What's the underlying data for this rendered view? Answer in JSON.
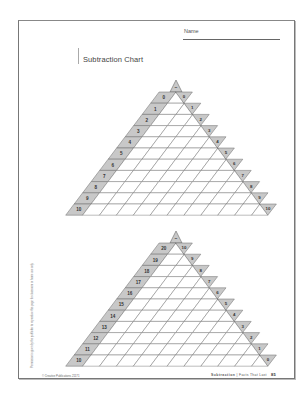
{
  "header": {
    "name_label": "Name",
    "title": "Subtraction Chart"
  },
  "charts": [
    {
      "id": "upper",
      "operator": "–",
      "row_labels": [
        "0",
        "1",
        "2",
        "3",
        "4",
        "5",
        "6",
        "7",
        "8",
        "9",
        "10"
      ],
      "diag_labels": [
        "0",
        "1",
        "2",
        "3",
        "4",
        "5",
        "6",
        "7",
        "8",
        "9",
        "10"
      ]
    },
    {
      "id": "lower",
      "operator": "–",
      "row_labels": [
        "20",
        "19",
        "18",
        "17",
        "16",
        "15",
        "14",
        "13",
        "12",
        "11",
        "10"
      ],
      "diag_labels": [
        "10",
        "9",
        "8",
        "7",
        "6",
        "5",
        "4",
        "3",
        "2",
        "1",
        "0"
      ]
    }
  ],
  "colors": {
    "line": "#6a6a6a",
    "header_fill": "#c8c8c8",
    "text": "#333333"
  },
  "footer": {
    "vertical_note": "Permission is given by the publisher to reproduce this page for classroom or home use only.",
    "copyright": "© Creative Publications 21171",
    "series": "Subtraction",
    "subtitle": "Facts That Last",
    "page_number": "85"
  }
}
